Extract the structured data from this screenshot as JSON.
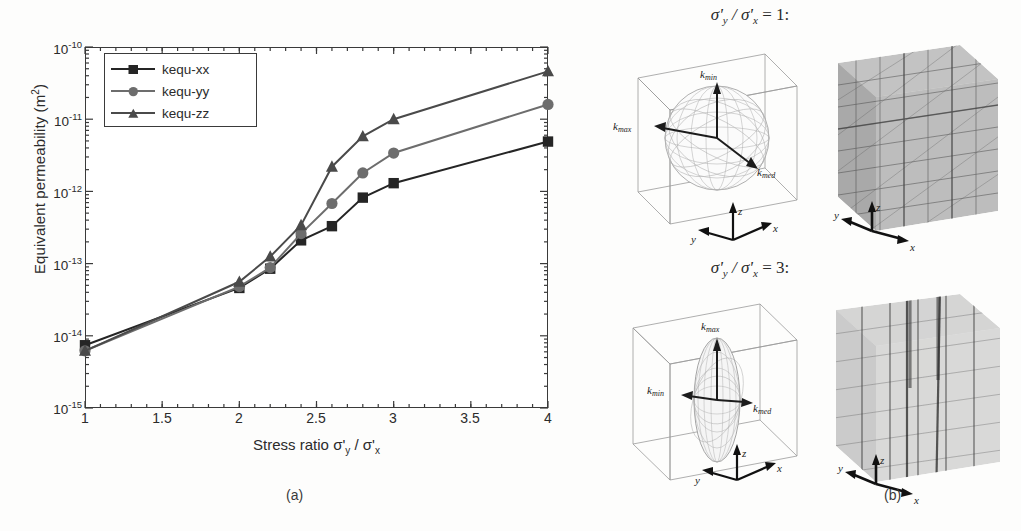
{
  "figure": {
    "caption_a": "(a)",
    "caption_b": "(b)"
  },
  "panel_a": {
    "ylabel_main": "Equivalent permeability (m",
    "ylabel_sup": "2",
    "ylabel_close": ")",
    "xlabel": "Stress ratio σ'",
    "xlabel_sub1": "y",
    "xlabel_mid": " / σ'",
    "xlabel_sub2": "x",
    "legend": [
      {
        "label": "kequ-xx",
        "marker": "square",
        "color": "#252525"
      },
      {
        "label": "kequ-yy",
        "marker": "circle",
        "color": "#6d6d6d"
      },
      {
        "label": "kequ-zz",
        "marker": "triangle",
        "color": "#4a4a4a"
      }
    ],
    "ytick_labels": [
      "10",
      "10",
      "10",
      "10",
      "10",
      "10"
    ],
    "ytick_exponents": [
      "-10",
      "-11",
      "-12",
      "-13",
      "-14",
      "-15"
    ],
    "xtick_labels": [
      "1",
      "1.5",
      "2",
      "2.5",
      "3",
      "3.5",
      "4"
    ]
  },
  "chart_data": {
    "type": "line",
    "title": "",
    "xlabel": "Stress ratio σ'y / σ'x",
    "ylabel": "Equivalent permeability (m2)",
    "yscale": "log",
    "xlim": [
      1,
      4
    ],
    "ylim": [
      1e-15,
      1e-10
    ],
    "xticks": [
      1,
      1.5,
      2,
      2.5,
      3,
      3.5,
      4
    ],
    "yticks": [
      1e-15,
      1e-14,
      1e-13,
      1e-12,
      1e-11,
      1e-10
    ],
    "grid": false,
    "legend_position": "upper-left",
    "x": [
      1,
      2,
      2.2,
      2.4,
      2.6,
      2.8,
      3,
      4
    ],
    "series": [
      {
        "name": "kequ-xx",
        "marker": "square",
        "color": "#252525",
        "values": [
          7.4e-15,
          4.6e-14,
          8.5e-14,
          2.1e-13,
          3.3e-13,
          8.2e-13,
          1.3e-12,
          4.9e-12
        ]
      },
      {
        "name": "kequ-yy",
        "marker": "circle",
        "color": "#6d6d6d",
        "values": [
          6.2e-15,
          4.8e-14,
          8.8e-14,
          2.6e-13,
          6.8e-13,
          1.8e-12,
          3.4e-12,
          1.6e-11
        ]
      },
      {
        "name": "kequ-zz",
        "marker": "triangle",
        "color": "#4a4a4a",
        "values": [
          6.2e-15,
          5.6e-14,
          1.25e-13,
          3.4e-13,
          2.2e-12,
          5.8e-12,
          1e-11,
          4.6e-11
        ]
      }
    ]
  },
  "panel_b": {
    "ratio_1": {
      "prefix": "σ'",
      "sub_y": "y",
      "mid": " / σ'",
      "sub_x": "x",
      "eq": " = 1:"
    },
    "ratio_3": {
      "prefix": "σ'",
      "sub_y": "y",
      "mid": " / σ'",
      "sub_x": "x",
      "eq": " = 3:"
    },
    "ellipsoid_1": {
      "shape": "sphere",
      "labels": {
        "kmin": "k",
        "kmin_sub": "min",
        "kmax": "k",
        "kmax_sub": "max",
        "kmed": "k",
        "kmed_sub": "med"
      },
      "axes": {
        "x": "x",
        "y": "y",
        "z": "z"
      }
    },
    "ellipsoid_2": {
      "shape": "prolate",
      "labels": {
        "kmax": "k",
        "kmax_sub": "max",
        "kmin": "k",
        "kmin_sub": "min",
        "kmed": "k",
        "kmed_sub": "med"
      },
      "axes": {
        "x": "x",
        "y": "y",
        "z": "z"
      }
    },
    "network_1": {
      "axes": {
        "x": "x",
        "y": "y",
        "z": "z"
      }
    },
    "network_2": {
      "axes": {
        "x": "x",
        "y": "y",
        "z": "z"
      }
    }
  }
}
